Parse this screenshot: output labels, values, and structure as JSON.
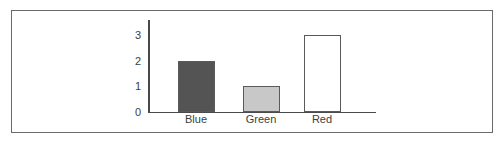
{
  "chart_data": {
    "type": "bar",
    "title": "",
    "subtitle": "",
    "xlabel": "",
    "ylabel": "",
    "categories": [
      "Blue",
      "Green",
      "Red"
    ],
    "values": [
      2,
      1,
      3
    ],
    "bar_colors": [
      "#545454",
      "#c8c8c8",
      "#ffffff"
    ],
    "bar_edge_color": "#5a5a5a",
    "ylim": [
      0,
      3.6
    ],
    "y_ticks": [
      0,
      1,
      2,
      3
    ],
    "y_tick_labels": [
      "0",
      "1",
      "2",
      "3"
    ],
    "grid": false,
    "legend": false,
    "legend_position": "none",
    "axis_color": "#4a4a4a",
    "frame_color": "#6a6a6a",
    "background": "#ffffff",
    "annotations": []
  },
  "figure": {
    "frame_visible": true
  }
}
